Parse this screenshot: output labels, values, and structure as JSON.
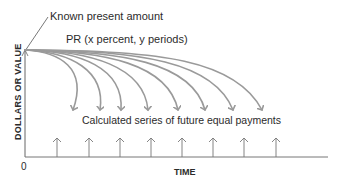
{
  "diagram": {
    "labels": {
      "known_present_amount": "Known present amount",
      "pr_formula": "PR (x percent, y periods)",
      "calculated_series": "Calculated series of future equal payments",
      "y_axis": "DOLLARS OR VALUE",
      "x_axis": "TIME",
      "origin": "0"
    },
    "colors": {
      "curve": "#9a9a9a",
      "axis": "#555555",
      "arrow": "#777777",
      "text": "#2b2b2b"
    },
    "origin_point": {
      "x": 25,
      "y": 50
    },
    "curve_endpoints_x": [
      73,
      100,
      121,
      148,
      178,
      205,
      233,
      262
    ],
    "payment_arrows_x": [
      57,
      89,
      120,
      151,
      182,
      213,
      244,
      276
    ],
    "payment_count": 8
  }
}
